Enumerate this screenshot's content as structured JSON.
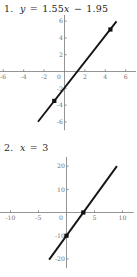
{
  "page": {
    "background_color": "#ffffff",
    "text_color": "#1a1a1a"
  },
  "problems": [
    {
      "number": "1.",
      "equation": "y = 1.55x − 1.95",
      "equation_parts": {
        "lhs": "y",
        "equals": "=",
        "slope": "1.55",
        "x_var": "x",
        "minus": "−",
        "intercept": "1.95"
      }
    },
    {
      "number": "2.",
      "equation": "x = 3",
      "equation_parts": {
        "lhs": "x",
        "equals": "=",
        "rhs": "3"
      }
    }
  ],
  "chart_data": [
    {
      "type": "line",
      "title": "",
      "xlabel": "",
      "ylabel": "",
      "xlim": [
        -7,
        7
      ],
      "ylim": [
        -7,
        7
      ],
      "xticks": [
        -6,
        -4,
        -2,
        0,
        2,
        4,
        6
      ],
      "xticklabels": [
        "-6",
        "-4",
        "-2",
        "0",
        "2",
        "4",
        "6"
      ],
      "yticks": [
        6,
        4,
        2,
        -2,
        -4,
        -6
      ],
      "yticklabels": [
        "6",
        "4",
        "2",
        "-2",
        "-4",
        "-6"
      ],
      "grid": false,
      "legend": "none",
      "series": [
        {
          "name": "y = 1.55x - 1.95",
          "slope": 1.55,
          "intercept": -1.95,
          "x": [
            -2.6,
            5.1
          ],
          "y": [
            -5.98,
            5.96
          ]
        }
      ],
      "markers": [
        {
          "x": -1,
          "y": -3.5
        },
        {
          "x": 4.5,
          "y": 5.0
        }
      ],
      "axis_color": "#7a7a7a",
      "line_color": "#141414",
      "marker_color": "#111111"
    },
    {
      "type": "line",
      "title": "",
      "xlabel": "",
      "ylabel": "",
      "xlim": [
        -12,
        12
      ],
      "ylim": [
        -24,
        24
      ],
      "xticks": [
        -10,
        -5,
        0,
        5,
        10
      ],
      "xticklabels": [
        "-10",
        "-5",
        "0",
        "5",
        "10"
      ],
      "yticks": [
        20,
        10,
        -10,
        -20
      ],
      "yticklabels": [
        "20",
        "10",
        "-10",
        "-20"
      ],
      "grid": false,
      "legend": "none",
      "series": [
        {
          "name": "x = 3",
          "slope": 3.33,
          "intercept": -10,
          "x": [
            -3.1,
            9.0
          ],
          "y": [
            -20.3,
            20.0
          ]
        }
      ],
      "markers": [
        {
          "x": 0,
          "y": -10
        },
        {
          "x": 3,
          "y": 0
        }
      ],
      "axis_color": "#7a7a7a",
      "line_color": "#141414",
      "marker_color": "#111111"
    }
  ]
}
